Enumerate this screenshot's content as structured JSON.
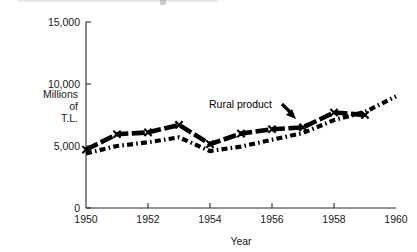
{
  "chart_data": {
    "type": "line",
    "title": "",
    "subtitle": "",
    "xlabel": "Year",
    "ylabel": "Millions of T.L.",
    "ylabel_lines": [
      "Millions",
      "of",
      "T.L."
    ],
    "xlim": [
      1950,
      1960
    ],
    "ylim": [
      0,
      15000
    ],
    "y_ticks": [
      0,
      5000,
      10000,
      15000
    ],
    "y_tick_labels": [
      "0",
      "5,000",
      "10,000",
      "15,000"
    ],
    "x_ticks": [
      1950,
      1952,
      1954,
      1956,
      1958,
      1960
    ],
    "x_tick_labels": [
      "1950",
      "1952",
      "1954",
      "1956",
      "1958",
      "1960"
    ],
    "grid": false,
    "legend": "none",
    "x": [
      1950,
      1951,
      1952,
      1953,
      1954,
      1955,
      1956,
      1957,
      1958,
      1959,
      1960
    ],
    "series": [
      {
        "name": "Rural product",
        "style": "thick-dashed-with-x-markers",
        "marker": "x",
        "values": [
          4700,
          5950,
          6100,
          6700,
          5150,
          6000,
          6350,
          6500,
          7700,
          7500,
          null
        ]
      },
      {
        "name": "Second series",
        "style": "dot-dash",
        "marker": "none",
        "values": [
          4400,
          5000,
          5300,
          5700,
          4600,
          4950,
          5500,
          6050,
          7100,
          7750,
          9000
        ]
      }
    ],
    "annotations": [
      {
        "text": "Rural product",
        "x": 1956.0,
        "y": 8100,
        "arrow": true,
        "arrow_direction": "down-right",
        "points_to_series": "Rural product"
      }
    ],
    "colors": {
      "axis": "#2b2b2b",
      "series_primary": "#000000",
      "series_secondary": "#000000",
      "background": "#ffffff"
    }
  },
  "axis": {
    "y_title_lines": [
      "Millions",
      "of",
      "T.L."
    ],
    "x_title": "Year"
  },
  "annotation": {
    "rural_product_label": "Rural product"
  }
}
